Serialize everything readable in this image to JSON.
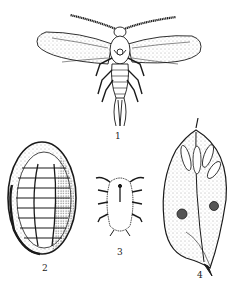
{
  "figure": {
    "colors": {
      "ink": "#1a1a1a",
      "background": "#ffffff",
      "stipple": "#555555"
    },
    "panels": [
      {
        "id": 1,
        "label": "1",
        "subject": "winged adult male insect"
      },
      {
        "id": 2,
        "label": "2",
        "subject": "oval female scale, dorsal view"
      },
      {
        "id": 3,
        "label": "3",
        "subject": "crawler nymph"
      },
      {
        "id": 4,
        "label": "4",
        "subject": "infested leaf with scales"
      }
    ]
  }
}
